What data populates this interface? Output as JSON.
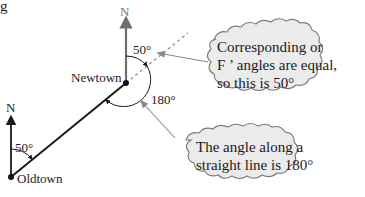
{
  "fragment": {
    "text": "g"
  },
  "places": {
    "newtown": {
      "label": "Newtown"
    },
    "oldtown": {
      "label": "Oldtown"
    }
  },
  "north_markers": [
    {
      "label": "N",
      "at": "Newtown"
    },
    {
      "label": "N",
      "at": "Oldtown"
    }
  ],
  "angles": {
    "newtown_corresponding": "50°",
    "newtown_straight": "180°",
    "oldtown_bearing": "50°"
  },
  "callouts": {
    "corresponding": {
      "lines": [
        "Corresponding or",
        "F ’ angles are equal,",
        "so this is 50°"
      ]
    },
    "straight_line": {
      "lines": [
        "The angle along a",
        "straight line is 180°"
      ]
    }
  },
  "colors": {
    "line": "#1a1a1a",
    "north_arrow": "#6f6f6f",
    "dashed": "#9a9a9a",
    "pointer": "#8a8a8a",
    "cloud_fill": "#ebebeb",
    "cloud_stroke": "#7a7a7a"
  }
}
